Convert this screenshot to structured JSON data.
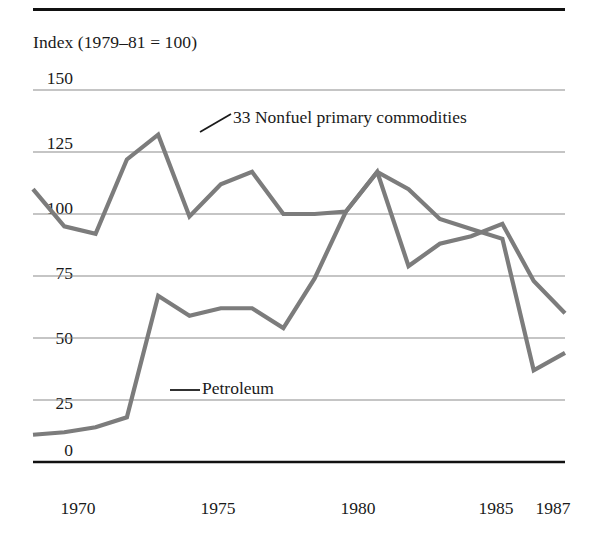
{
  "figure": {
    "axis_title": "Index (1979–81 = 100)",
    "line_color": "#7c7c7c",
    "grid_color": "#8c8c8c",
    "rule_color": "#111111"
  },
  "annotations": {
    "commodities_label": "33 Nonfuel primary commodities",
    "petroleum_label": "Petroleum"
  },
  "yticks": [
    {
      "label": "150",
      "value": 150
    },
    {
      "label": "125",
      "value": 125
    },
    {
      "label": "100",
      "value": 100
    },
    {
      "label": "75",
      "value": 75
    },
    {
      "label": "50",
      "value": 50
    },
    {
      "label": "25",
      "value": 25
    },
    {
      "label": "0",
      "value": 0
    }
  ],
  "xticks": [
    {
      "label": "1970",
      "value": 1970
    },
    {
      "label": "1975",
      "value": 1975
    },
    {
      "label": "1980",
      "value": 1980
    },
    {
      "label": "1985",
      "value": 1985
    },
    {
      "label": "1987",
      "value": 1987
    }
  ],
  "chart_data": {
    "type": "line",
    "title": "",
    "subtitle": "",
    "xlabel": "",
    "ylabel": "Index (1979–81 = 100)",
    "xlim": [
      1970,
      1987
    ],
    "ylim": [
      0,
      150
    ],
    "grid": true,
    "legend": "annotations-on-plot",
    "x": [
      1970,
      1971,
      1972,
      1973,
      1974,
      1975,
      1976,
      1977,
      1978,
      1979,
      1980,
      1981,
      1982,
      1983,
      1984,
      1985,
      1986,
      1987
    ],
    "series": [
      {
        "name": "33 Nonfuel primary commodities",
        "color": "#7c7c7c",
        "values": [
          110,
          95,
          92,
          122,
          132,
          99,
          112,
          117,
          100,
          100,
          101,
          117,
          79,
          88,
          91,
          96,
          73,
          60
        ]
      },
      {
        "name": "Petroleum",
        "color": "#7c7c7c",
        "values": [
          11,
          12,
          14,
          18,
          67,
          59,
          62,
          62,
          54,
          74,
          101,
          117,
          110,
          98,
          94,
          90,
          37,
          44
        ]
      }
    ]
  }
}
